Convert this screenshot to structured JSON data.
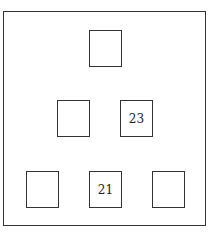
{
  "diagram": {
    "type": "number-pyramid",
    "rows": [
      {
        "cells": [
          {
            "value": ""
          }
        ]
      },
      {
        "cells": [
          {
            "value": ""
          },
          {
            "value": "23"
          }
        ]
      },
      {
        "cells": [
          {
            "value": ""
          },
          {
            "value": "21"
          },
          {
            "value": ""
          }
        ]
      }
    ]
  }
}
